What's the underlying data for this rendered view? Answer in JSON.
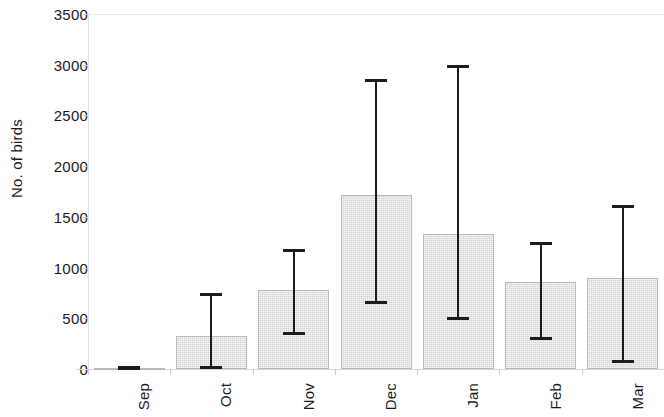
{
  "chart_data": {
    "type": "bar",
    "title": "",
    "xlabel": "",
    "ylabel": "No. of birds",
    "categories": [
      "Sep",
      "Oct",
      "Nov",
      "Dec",
      "Jan",
      "Feb",
      "Mar"
    ],
    "values": [
      10,
      330,
      780,
      1720,
      1330,
      860,
      900
    ],
    "error_low": [
      0,
      0,
      340,
      640,
      480,
      285,
      60
    ],
    "error_high": [
      20,
      750,
      1180,
      2860,
      3000,
      1250,
      1620
    ],
    "series": [
      {
        "name": "No. of birds",
        "values": [
          10,
          330,
          780,
          1720,
          1330,
          860,
          900
        ],
        "error_low": [
          0,
          0,
          340,
          640,
          480,
          285,
          60
        ],
        "error_high": [
          20,
          750,
          1180,
          2860,
          3000,
          1250,
          1620
        ]
      }
    ],
    "ylim": [
      0,
      3500
    ],
    "y_ticks": [
      0,
      500,
      1000,
      1500,
      2000,
      2500,
      3000,
      3500
    ],
    "y_tick_labels": [
      "0",
      "500",
      "1000",
      "1500",
      "2000",
      "2500",
      "3000",
      "3500"
    ],
    "grid": false,
    "legend": null,
    "legend_position": "none",
    "bar_color": "#d2d2d2",
    "bar_edge_color": "#b9b9b9",
    "error_bar_color": "#1c1c1c",
    "axis_color": "#d8d8d8",
    "text_color": "#1a1a1a",
    "x_tick_label_rotation": 90
  }
}
